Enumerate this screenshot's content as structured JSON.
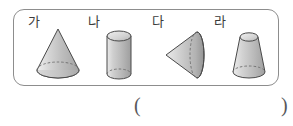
{
  "page": {
    "background_color": "#ffffff",
    "panel_border_color": "#8d8d8d",
    "shape_outline_color": "#4a4a4a",
    "shape_fill_light": "#e3e3e3",
    "shape_fill_mid": "#c2c2c2",
    "shape_fill_dark": "#9a9a9a",
    "hidden_edge_style": "dashed"
  },
  "figures": [
    {
      "label": "가",
      "icon": "cone-upright-icon",
      "shape": "cone",
      "description": "원뿔 (cone standing upright, apex on top)"
    },
    {
      "label": "나",
      "icon": "cylinder-icon",
      "shape": "cylinder",
      "description": "원기둥 (cylinder standing upright)"
    },
    {
      "label": "다",
      "icon": "cone-sideways-icon",
      "shape": "cone",
      "description": "원뿔 (cone lying on its side, apex pointing left)"
    },
    {
      "label": "라",
      "icon": "frustum-icon",
      "shape": "truncated-cone",
      "description": "원뿔대 (truncated cone / frustum)"
    }
  ],
  "answer": {
    "open_paren": "(",
    "close_paren": ")",
    "value": ""
  }
}
